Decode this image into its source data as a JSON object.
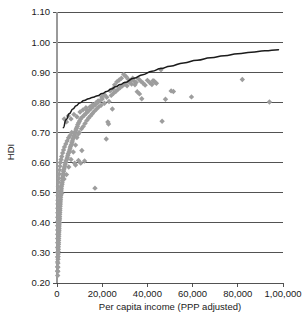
{
  "chart_data": {
    "type": "scatter",
    "title": "",
    "xlabel": "Per capita income (PPP adjusted)",
    "ylabel": "HDI",
    "xlim": [
      0,
      100000
    ],
    "ylim": [
      0.2,
      1.1
    ],
    "grid": "horizontal",
    "legend_position": "none",
    "marker_shape": "diamond",
    "marker_color": "#9d9d9d",
    "curve_color": "#1b1b1b",
    "gridline_color": "#3f3f3f",
    "axis_color": "#9a9a9a",
    "xticks": [
      0,
      20000,
      40000,
      60000,
      80000,
      100000
    ],
    "xtick_labels": [
      "0",
      "20,000",
      "40,000",
      "60,000",
      "80,000",
      "1,00,000"
    ],
    "yticks": [
      0.2,
      0.3,
      0.4,
      0.5,
      0.6,
      0.7,
      0.8,
      0.9,
      1.0,
      1.1
    ],
    "ytick_labels": [
      "0.20",
      "0.30",
      "0.40",
      "0.50",
      "0.60",
      "0.70",
      "0.80",
      "0.90",
      "1.00",
      "1.10"
    ],
    "series": [
      {
        "name": "Countries",
        "marker": "diamond",
        "points": [
          [
            300,
            0.225
          ],
          [
            350,
            0.238
          ],
          [
            400,
            0.252
          ],
          [
            420,
            0.266
          ],
          [
            450,
            0.279
          ],
          [
            500,
            0.288
          ],
          [
            520,
            0.296
          ],
          [
            560,
            0.305
          ],
          [
            600,
            0.312
          ],
          [
            620,
            0.32
          ],
          [
            660,
            0.328
          ],
          [
            700,
            0.334
          ],
          [
            720,
            0.341
          ],
          [
            760,
            0.348
          ],
          [
            800,
            0.355
          ],
          [
            830,
            0.362
          ],
          [
            860,
            0.369
          ],
          [
            900,
            0.375
          ],
          [
            930,
            0.382
          ],
          [
            960,
            0.389
          ],
          [
            1000,
            0.396
          ],
          [
            1040,
            0.402
          ],
          [
            1080,
            0.409
          ],
          [
            1120,
            0.415
          ],
          [
            1160,
            0.421
          ],
          [
            1200,
            0.428
          ],
          [
            1240,
            0.434
          ],
          [
            1280,
            0.441
          ],
          [
            1320,
            0.447
          ],
          [
            1360,
            0.454
          ],
          [
            1400,
            0.46
          ],
          [
            1450,
            0.466
          ],
          [
            1500,
            0.472
          ],
          [
            1550,
            0.478
          ],
          [
            1600,
            0.485
          ],
          [
            1650,
            0.491
          ],
          [
            1700,
            0.497
          ],
          [
            1760,
            0.503
          ],
          [
            1820,
            0.496
          ],
          [
            1880,
            0.509
          ],
          [
            1940,
            0.515
          ],
          [
            2000,
            0.521
          ],
          [
            2100,
            0.498
          ],
          [
            2200,
            0.527
          ],
          [
            2300,
            0.533
          ],
          [
            2400,
            0.54
          ],
          [
            2500,
            0.546
          ],
          [
            2600,
            0.552
          ],
          [
            2700,
            0.558
          ],
          [
            2800,
            0.564
          ],
          [
            2900,
            0.57
          ],
          [
            3000,
            0.576
          ],
          [
            3100,
            0.545
          ],
          [
            3200,
            0.582
          ],
          [
            3400,
            0.588
          ],
          [
            3600,
            0.594
          ],
          [
            3800,
            0.6
          ],
          [
            4000,
            0.606
          ],
          [
            4200,
            0.56
          ],
          [
            4400,
            0.612
          ],
          [
            4600,
            0.618
          ],
          [
            4800,
            0.624
          ],
          [
            5000,
            0.63
          ],
          [
            5200,
            0.585
          ],
          [
            5400,
            0.636
          ],
          [
            5600,
            0.642
          ],
          [
            5800,
            0.648
          ],
          [
            6000,
            0.654
          ],
          [
            6200,
            0.61
          ],
          [
            6400,
            0.66
          ],
          [
            6600,
            0.666
          ],
          [
            6800,
            0.672
          ],
          [
            7000,
            0.678
          ],
          [
            7200,
            0.635
          ],
          [
            7400,
            0.684
          ],
          [
            7600,
            0.69
          ],
          [
            7800,
            0.696
          ],
          [
            8000,
            0.702
          ],
          [
            8200,
            0.658
          ],
          [
            8400,
            0.708
          ],
          [
            8600,
            0.714
          ],
          [
            8800,
            0.683
          ],
          [
            9000,
            0.72
          ],
          [
            9200,
            0.726
          ],
          [
            9400,
            0.695
          ],
          [
            9600,
            0.732
          ],
          [
            9800,
            0.7
          ],
          [
            10000,
            0.738
          ],
          [
            10400,
            0.745
          ],
          [
            10800,
            0.712
          ],
          [
            11200,
            0.751
          ],
          [
            11600,
            0.72
          ],
          [
            12000,
            0.757
          ],
          [
            12400,
            0.73
          ],
          [
            12800,
            0.763
          ],
          [
            13200,
            0.74
          ],
          [
            13600,
            0.769
          ],
          [
            14000,
            0.748
          ],
          [
            14400,
            0.775
          ],
          [
            14800,
            0.755
          ],
          [
            15200,
            0.781
          ],
          [
            15600,
            0.762
          ],
          [
            16000,
            0.787
          ],
          [
            16500,
            0.77
          ],
          [
            17000,
            0.793
          ],
          [
            17500,
            0.778
          ],
          [
            18000,
            0.799
          ],
          [
            18500,
            0.785
          ],
          [
            19000,
            0.805
          ],
          [
            19500,
            0.79
          ],
          [
            20000,
            0.811
          ],
          [
            21000,
            0.797
          ],
          [
            22000,
            0.817
          ],
          [
            23000,
            0.803
          ],
          [
            24000,
            0.823
          ],
          [
            25000,
            0.83
          ],
          [
            26000,
            0.836
          ],
          [
            27000,
            0.843
          ],
          [
            28000,
            0.849
          ],
          [
            29000,
            0.855
          ],
          [
            30000,
            0.861
          ],
          [
            31000,
            0.855
          ],
          [
            32000,
            0.867
          ],
          [
            33000,
            0.861
          ],
          [
            34000,
            0.872
          ],
          [
            35000,
            0.866
          ],
          [
            36000,
            0.878
          ],
          [
            37000,
            0.871
          ],
          [
            38000,
            0.864
          ],
          [
            39000,
            0.857
          ],
          [
            40000,
            0.873
          ],
          [
            41000,
            0.866
          ],
          [
            42000,
            0.859
          ],
          [
            43000,
            0.87
          ],
          [
            44000,
            0.863
          ],
          [
            3200,
            0.745
          ],
          [
            4200,
            0.735
          ],
          [
            5000,
            0.755
          ],
          [
            6200,
            0.745
          ],
          [
            7500,
            0.76
          ],
          [
            8800,
            0.752
          ],
          [
            10200,
            0.768
          ],
          [
            11500,
            0.775
          ],
          [
            12800,
            0.782
          ],
          [
            9500,
            0.607
          ],
          [
            11000,
            0.64
          ],
          [
            12200,
            0.605
          ],
          [
            10500,
            0.598
          ],
          [
            7800,
            0.598
          ],
          [
            8200,
            0.592
          ],
          [
            16800,
            0.515
          ],
          [
            21800,
            0.678
          ],
          [
            22500,
            0.735
          ],
          [
            22800,
            0.728
          ],
          [
            24500,
            0.778
          ],
          [
            29500,
            0.893
          ],
          [
            30500,
            0.886
          ],
          [
            33500,
            0.88
          ],
          [
            35500,
            0.835
          ],
          [
            36500,
            0.828
          ],
          [
            37500,
            0.812
          ],
          [
            42500,
            0.872
          ],
          [
            43500,
            0.866
          ],
          [
            46000,
            0.908
          ],
          [
            46500,
            0.737
          ],
          [
            48000,
            0.81
          ],
          [
            50500,
            0.838
          ],
          [
            51500,
            0.836
          ],
          [
            59500,
            0.818
          ],
          [
            82000,
            0.876
          ],
          [
            94000,
            0.801
          ],
          [
            26500,
            0.868
          ],
          [
            27500,
            0.874
          ],
          [
            28500,
            0.88
          ],
          [
            31500,
            0.877
          ],
          [
            32500,
            0.871
          ],
          [
            34500,
            0.858
          ],
          [
            25500,
            0.858
          ],
          [
            24800,
            0.845
          ],
          [
            23500,
            0.838
          ],
          [
            21000,
            0.825
          ],
          [
            19800,
            0.818
          ],
          [
            18200,
            0.805
          ],
          [
            17200,
            0.798
          ],
          [
            15800,
            0.792
          ],
          [
            14600,
            0.785
          ],
          [
            13400,
            0.772
          ],
          [
            6500,
            0.7
          ],
          [
            5800,
            0.69
          ],
          [
            5100,
            0.682
          ],
          [
            4500,
            0.672
          ],
          [
            3900,
            0.662
          ],
          [
            3300,
            0.652
          ],
          [
            2900,
            0.642
          ],
          [
            2500,
            0.632
          ],
          [
            2100,
            0.62
          ],
          [
            1800,
            0.61
          ],
          [
            1500,
            0.6
          ],
          [
            1300,
            0.588
          ],
          [
            1100,
            0.575
          ],
          [
            950,
            0.562
          ],
          [
            820,
            0.548
          ],
          [
            700,
            0.535
          ],
          [
            600,
            0.52
          ],
          [
            520,
            0.505
          ],
          [
            460,
            0.49
          ],
          [
            420,
            0.475
          ],
          [
            380,
            0.462
          ],
          [
            350,
            0.448
          ],
          [
            330,
            0.433
          ],
          [
            310,
            0.418
          ],
          [
            300,
            0.404
          ],
          [
            290,
            0.39
          ],
          [
            285,
            0.376
          ],
          [
            280,
            0.362
          ],
          [
            275,
            0.348
          ],
          [
            270,
            0.334
          ],
          [
            265,
            0.318
          ],
          [
            260,
            0.302
          ],
          [
            255,
            0.286
          ],
          [
            250,
            0.27
          ],
          [
            245,
            0.254
          ],
          [
            240,
            0.24
          ]
        ]
      }
    ],
    "trend_curve": {
      "name": "Logarithmic fit",
      "description": "Fitted logarithmic trend of HDI against per capita income",
      "points": [
        [
          2800,
          0.716
        ],
        [
          4000,
          0.742
        ],
        [
          5500,
          0.763
        ],
        [
          7000,
          0.778
        ],
        [
          8500,
          0.789
        ],
        [
          10000,
          0.798
        ],
        [
          12000,
          0.806
        ],
        [
          14000,
          0.812
        ],
        [
          16000,
          0.817
        ],
        [
          18000,
          0.822
        ],
        [
          20000,
          0.829
        ],
        [
          22000,
          0.836
        ],
        [
          24000,
          0.844
        ],
        [
          26000,
          0.852
        ],
        [
          28000,
          0.859
        ],
        [
          30000,
          0.866
        ],
        [
          34000,
          0.88
        ],
        [
          38000,
          0.892
        ],
        [
          42000,
          0.903
        ],
        [
          46000,
          0.912
        ],
        [
          50000,
          0.92
        ],
        [
          56000,
          0.931
        ],
        [
          62000,
          0.94
        ],
        [
          68000,
          0.948
        ],
        [
          74000,
          0.955
        ],
        [
          80000,
          0.961
        ],
        [
          86000,
          0.966
        ],
        [
          92000,
          0.971
        ],
        [
          98000,
          0.975
        ]
      ]
    }
  },
  "plot_geometry": {
    "left": 57,
    "right": 283,
    "top": 12,
    "bottom": 283
  }
}
